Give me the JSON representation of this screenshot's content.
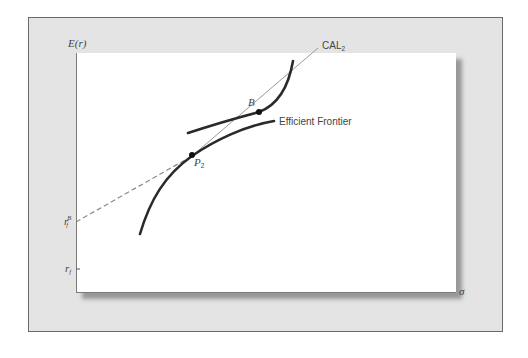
{
  "figure": {
    "y_axis_label": "E(r)",
    "x_axis_label": "σ",
    "y_ticks": [
      {
        "base": "r",
        "sub": "f",
        "sup": "B",
        "name": "borrowing-rate"
      },
      {
        "base": "r",
        "sub": "f",
        "sup": "",
        "name": "risk-free-rate"
      }
    ],
    "points": [
      {
        "label": "B",
        "name": "point-b"
      },
      {
        "label": "P",
        "sub": "2",
        "name": "point-p2"
      }
    ],
    "line_labels": {
      "cal": {
        "base": "CAL",
        "sub": "2"
      },
      "frontier": "Efficient Frontier"
    },
    "colors": {
      "panel_bg": "#e4e4e4",
      "plot_bg": "#ffffff",
      "curve": "#2a2a2a",
      "cal_line": "#9a9a9a",
      "dashed_line": "#8a8a8a",
      "text": "#444444"
    }
  }
}
